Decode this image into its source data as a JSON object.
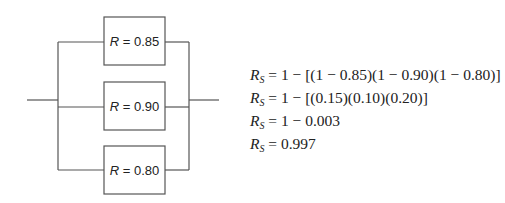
{
  "diagram": {
    "type": "parallel-reliability-block-diagram",
    "blocks": [
      {
        "label_var": "R",
        "label_eq": " = ",
        "value": "0.85"
      },
      {
        "label_var": "R",
        "label_eq": " = ",
        "value": "0.90"
      },
      {
        "label_var": "R",
        "label_eq": " = ",
        "value": "0.80"
      }
    ]
  },
  "equations": [
    {
      "lhs": "R",
      "sub": "S",
      "rhs": " = 1 − [(1 − 0.85)(1 − 0.90)(1 − 0.80)]"
    },
    {
      "lhs": "R",
      "sub": "S",
      "rhs": " = 1 − [(0.15)(0.10)(0.20)]"
    },
    {
      "lhs": "R",
      "sub": "S",
      "rhs": " = 1 − 0.003"
    },
    {
      "lhs": "R",
      "sub": "S",
      "rhs": " = 0.997"
    }
  ]
}
